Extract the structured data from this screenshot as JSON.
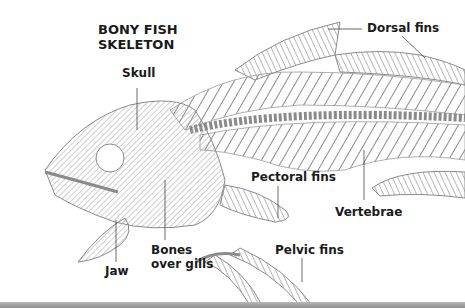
{
  "title": {
    "line1": "BONY FISH",
    "line2": "SKELETON"
  },
  "labels": {
    "skull": "Skull",
    "dorsal_fins": "Dorsal fins",
    "pectoral_fins": "Pectoral fins",
    "vertebrae": "Vertebrae",
    "jaw": "Jaw",
    "bones_over_gills_line1": "Bones",
    "bones_over_gills_line2": "over gills",
    "pelvic_fins": "Pelvic fins"
  },
  "colors": {
    "background": "#ffffff",
    "bone": "#9a9a9a",
    "bone_dark": "#6e6e6e",
    "label_text": "#1a1a1a",
    "leader_line": "#444444",
    "bottom_strip": "#9a9a9a"
  }
}
